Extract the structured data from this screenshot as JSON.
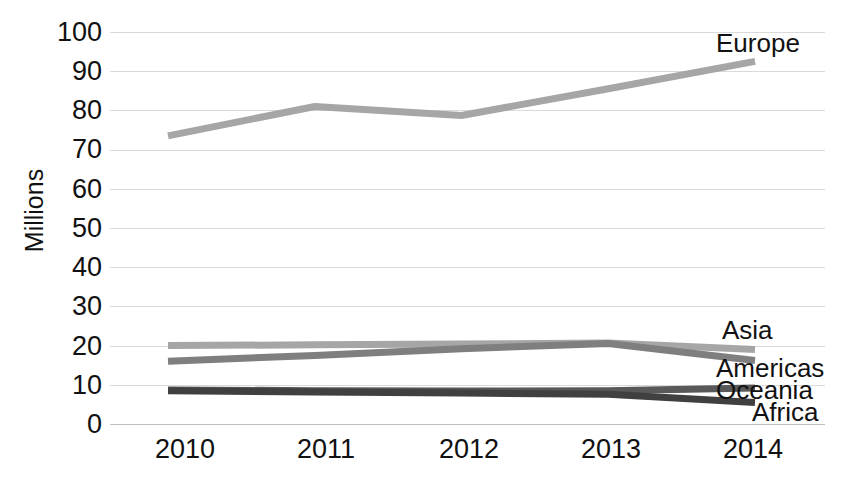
{
  "chart_data": {
    "type": "line",
    "title": "",
    "xlabel": "",
    "ylabel": "Millions",
    "categories": [
      "2010",
      "2011",
      "2012",
      "2013",
      "2014"
    ],
    "x": [
      2010,
      2011,
      2012,
      2013,
      2014
    ],
    "ylim": [
      0,
      100
    ],
    "ytick_values": [
      0,
      10,
      20,
      30,
      40,
      50,
      60,
      70,
      80,
      90,
      100
    ],
    "ytick_labels": [
      "0",
      "10",
      "20",
      "30",
      "40",
      "50",
      "60",
      "70",
      "80",
      "90",
      "100"
    ],
    "grid": "horizontal",
    "legend": "direct-labels-right",
    "series": [
      {
        "name": "Europe",
        "values": [
          73.5,
          81.0,
          78.7,
          85.5,
          92.5
        ],
        "color": "#a6a6a6",
        "label": "Europe"
      },
      {
        "name": "Asia",
        "values": [
          20.0,
          20.2,
          20.4,
          20.7,
          19.0
        ],
        "color": "#a6a6a6",
        "label": "Asia"
      },
      {
        "name": "Americas",
        "values": [
          16.0,
          17.5,
          19.2,
          20.5,
          16.2
        ],
        "color": "#7f7f7f",
        "label": "Americas"
      },
      {
        "name": "Oceania",
        "values": [
          8.7,
          8.5,
          8.4,
          8.5,
          9.2
        ],
        "color": "#595959",
        "label": "Oceania"
      },
      {
        "name": "Africa",
        "values": [
          8.5,
          8.2,
          7.9,
          7.6,
          5.5
        ],
        "color": "#404040",
        "label": "Africa"
      }
    ]
  },
  "axis": {
    "y_title": "Millions",
    "y_labels": [
      "100",
      "90",
      "80",
      "70",
      "60",
      "50",
      "40",
      "30",
      "20",
      "10",
      "0"
    ],
    "x_labels": [
      "2010",
      "2011",
      "2012",
      "2013",
      "2014"
    ]
  },
  "labels": {
    "europe": "Europe",
    "asia": "Asia",
    "americas": "Americas",
    "oceania": "Oceania",
    "africa": "Africa"
  },
  "colors": {
    "gridline": "#d9d9d9",
    "text": "#111111",
    "europe": "#a6a6a6",
    "asia": "#a6a6a6",
    "americas": "#7f7f7f",
    "oceania": "#595959",
    "africa": "#404040"
  }
}
